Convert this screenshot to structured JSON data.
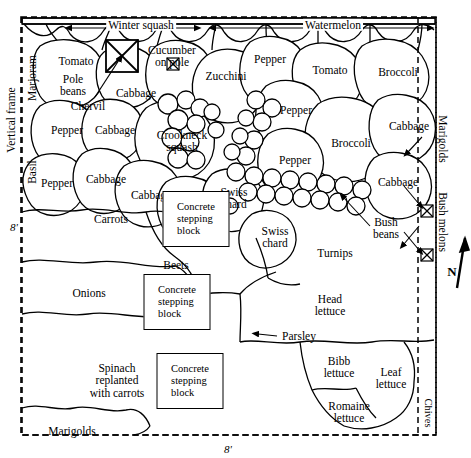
{
  "diagram": {
    "frame": {
      "style": "dashed",
      "color": "#000000",
      "width_label": "8'",
      "height_label": "8'"
    },
    "edge_labels": [
      {
        "name": "vertical-frame",
        "text": "Vertical frame",
        "x": 11,
        "y": 120,
        "orient": "vertical-ccw"
      },
      {
        "name": "marjoram",
        "text": "Marjoram",
        "x": 32,
        "y": 78,
        "orient": "vertical-ccw"
      },
      {
        "name": "basil",
        "text": "Basil",
        "x": 32,
        "y": 172,
        "orient": "vertical-ccw"
      },
      {
        "name": "dimension-left",
        "text": "8'",
        "x": 14,
        "y": 228,
        "orient": "horizontal"
      },
      {
        "name": "dimension-bottom",
        "text": "8'",
        "x": 228,
        "y": 450,
        "orient": "horizontal"
      },
      {
        "name": "marigolds-right",
        "text": "Marigolds",
        "x": 443,
        "y": 139,
        "orient": "vertical-cw"
      },
      {
        "name": "bush-melons",
        "text": "Bush melons",
        "x": 443,
        "y": 222,
        "orient": "vertical-cw"
      },
      {
        "name": "chives",
        "text": "Chives",
        "x": 428,
        "y": 413,
        "orient": "vertical-cw"
      },
      {
        "name": "north-arrow-label",
        "text": "N",
        "x": 459,
        "y": 265,
        "orient": "horizontal"
      }
    ],
    "trellis_labels": [
      {
        "name": "winter-squash",
        "text": "Winter squash",
        "x": 141,
        "y": 25
      },
      {
        "name": "watermelon",
        "text": "Watermelon",
        "x": 333,
        "y": 25
      }
    ],
    "plant_labels": [
      {
        "name": "tomato-upper-left",
        "text": "Tomato",
        "x": 76,
        "y": 61
      },
      {
        "name": "pole-beans",
        "text": "Pole\nbeans",
        "x": 73,
        "y": 85
      },
      {
        "name": "chervil",
        "text": "Chervil",
        "x": 88,
        "y": 106
      },
      {
        "name": "cucumber-on-pole",
        "text": "Cucumber\non pole",
        "x": 172,
        "y": 56
      },
      {
        "name": "cabbage-top",
        "text": "Cabbage",
        "x": 136,
        "y": 93
      },
      {
        "name": "zucchini",
        "text": "Zucchini",
        "x": 226,
        "y": 76
      },
      {
        "name": "pepper-top-right",
        "text": "Pepper",
        "x": 270,
        "y": 59
      },
      {
        "name": "tomato-top-right",
        "text": "Tomato",
        "x": 330,
        "y": 70
      },
      {
        "name": "broccoli-top-right",
        "text": "Broccoli",
        "x": 398,
        "y": 72
      },
      {
        "name": "pepper-left-upper",
        "text": "Pepper",
        "x": 67,
        "y": 130
      },
      {
        "name": "cabbage-left-upper",
        "text": "Cabbage",
        "x": 115,
        "y": 130
      },
      {
        "name": "crookneck-squash",
        "text": "Crookneck\nsquash",
        "x": 182,
        "y": 141
      },
      {
        "name": "pepper-right-mid",
        "text": "Pepper",
        "x": 296,
        "y": 110
      },
      {
        "name": "cabbage-right-upper",
        "text": "Cabbage",
        "x": 409,
        "y": 126
      },
      {
        "name": "broccoli-right-mid",
        "text": "Broccoli",
        "x": 351,
        "y": 143
      },
      {
        "name": "pepper-left-lower",
        "text": "Pepper",
        "x": 57,
        "y": 183
      },
      {
        "name": "cabbage-left-mid",
        "text": "Cabbage",
        "x": 106,
        "y": 179
      },
      {
        "name": "pepper-center-right",
        "text": "Pepper",
        "x": 295,
        "y": 160
      },
      {
        "name": "cabbage-center",
        "text": "Cabbage",
        "x": 151,
        "y": 195
      },
      {
        "name": "cabbage-center-lower",
        "text": "Cabbage",
        "x": 187,
        "y": 208
      },
      {
        "name": "cabbage-right-lower",
        "text": "Cabbage",
        "x": 398,
        "y": 182
      },
      {
        "name": "swiss-chard-upper",
        "text": "Swiss\nchard",
        "x": 234,
        "y": 198
      },
      {
        "name": "carrots",
        "text": "Carrots",
        "x": 111,
        "y": 219
      },
      {
        "name": "swiss-chard-lower",
        "text": "Swiss\nchard",
        "x": 275,
        "y": 237
      },
      {
        "name": "bush-beans",
        "text": "Bush\nbeans",
        "x": 386,
        "y": 228
      },
      {
        "name": "turnips",
        "text": "Turnips",
        "x": 335,
        "y": 253
      },
      {
        "name": "beets",
        "text": "Beets",
        "x": 176,
        "y": 265
      },
      {
        "name": "onions",
        "text": "Onions",
        "x": 89,
        "y": 293
      },
      {
        "name": "head-lettuce",
        "text": "Head\nlettuce",
        "x": 330,
        "y": 305
      },
      {
        "name": "parsley",
        "text": "Parsley",
        "x": 299,
        "y": 336
      },
      {
        "name": "spinach-replanted",
        "text": "Spinach\nreplanted\nwith carrots",
        "x": 117,
        "y": 381
      },
      {
        "name": "bibb-lettuce",
        "text": "Bibb\nlettuce",
        "x": 339,
        "y": 367
      },
      {
        "name": "leaf-lettuce",
        "text": "Leaf\nlettuce",
        "x": 391,
        "y": 378
      },
      {
        "name": "romaine-lettuce",
        "text": "Romaine\nlettuce",
        "x": 349,
        "y": 412
      },
      {
        "name": "marigolds-bottom",
        "text": "Marigolds",
        "x": 72,
        "y": 431
      }
    ],
    "stepping_blocks": [
      {
        "name": "stepping-block-1",
        "text": "Concrete\nstepping\nblock",
        "x": 196,
        "y": 219,
        "w": 65,
        "h": 54
      },
      {
        "name": "stepping-block-2",
        "text": "Concrete\nstepping\nblock",
        "x": 177,
        "y": 302,
        "w": 65,
        "h": 54
      },
      {
        "name": "stepping-block-3",
        "text": "Concrete\nstepping\nblock",
        "x": 190,
        "y": 381,
        "w": 65,
        "h": 54
      }
    ]
  }
}
